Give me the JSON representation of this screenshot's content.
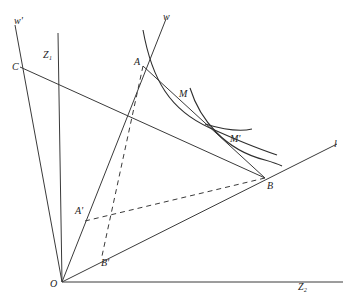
{
  "figure": {
    "type": "economic-geometry-diagram",
    "labels": {
      "w_prime": "w'",
      "z1": "Z₁",
      "c": "C",
      "w": "w",
      "a": "A",
      "m": "M",
      "m_prime": "M'",
      "l": "l",
      "b": "B",
      "a_prime": "A'",
      "b_prime": "B'",
      "o": "O",
      "z2": "Z₂"
    },
    "points": {
      "O": [
        62,
        282
      ],
      "A": [
        143,
        66
      ],
      "B": [
        265,
        178
      ],
      "C": [
        20,
        67
      ],
      "A_prime": [
        85,
        220
      ],
      "B_prime": [
        102,
        254
      ]
    },
    "rays": [
      {
        "name": "Z1-axis",
        "from": "O",
        "to": [
          58,
          33
        ]
      },
      {
        "name": "Z2-axis",
        "from": "O",
        "to": [
          343,
          282
        ]
      },
      {
        "name": "w",
        "from": "O",
        "to": [
          166,
          19
        ]
      },
      {
        "name": "w-prime",
        "from": "O",
        "to": [
          15,
          25
        ]
      },
      {
        "name": "l",
        "from": "O",
        "to": [
          337,
          144
        ]
      }
    ],
    "segments": [
      {
        "name": "CB",
        "from": "C",
        "to": "B",
        "style": "solid"
      },
      {
        "name": "AB",
        "from": "A",
        "to": "B",
        "style": "solid"
      },
      {
        "name": "AB-prime",
        "from": "A",
        "to": "B_prime",
        "style": "dashed"
      },
      {
        "name": "A-prime-B",
        "from": "A_prime",
        "to": "B",
        "style": "dashed"
      }
    ],
    "curves": [
      {
        "name": "indifference-curve-M",
        "label": "M"
      },
      {
        "name": "indifference-curve-M-prime",
        "label": "M'"
      }
    ],
    "stroke_color": "#3a3a3a",
    "background": "#ffffff"
  }
}
